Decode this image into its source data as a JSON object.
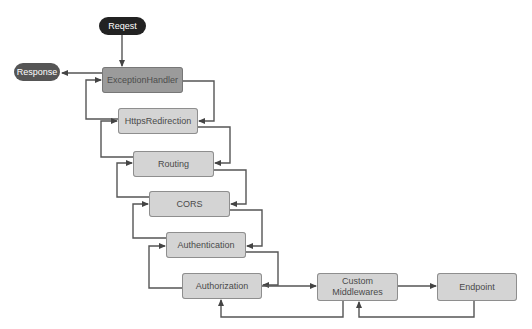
{
  "diagram": {
    "colors": {
      "request_fill": "#222222",
      "response_fill": "#555555",
      "highlight_node_fill": "#9b9b9b",
      "node_fill": "#d4d4d4",
      "edge": "#555555"
    },
    "terminals": {
      "request": "Reqest",
      "response": "Response"
    },
    "nodes": [
      {
        "id": "exception_handler",
        "label": "ExceptionHandler"
      },
      {
        "id": "https_redirection",
        "label": "HttpsRedirection"
      },
      {
        "id": "routing",
        "label": "Routing"
      },
      {
        "id": "cors",
        "label": "CORS"
      },
      {
        "id": "authentication",
        "label": "Authentication"
      },
      {
        "id": "authorization",
        "label": "Authorization"
      },
      {
        "id": "custom_middlewares",
        "label": "Custom Middlewares"
      },
      {
        "id": "endpoint",
        "label": "Endpoint"
      }
    ],
    "edges": [
      {
        "from": "request",
        "to": "exception_handler"
      },
      {
        "from": "exception_handler",
        "to": "https_redirection"
      },
      {
        "from": "https_redirection",
        "to": "routing"
      },
      {
        "from": "routing",
        "to": "cors"
      },
      {
        "from": "cors",
        "to": "authentication"
      },
      {
        "from": "authentication",
        "to": "authorization"
      },
      {
        "from": "authorization",
        "to": "custom_middlewares"
      },
      {
        "from": "custom_middlewares",
        "to": "endpoint"
      },
      {
        "from": "endpoint",
        "to": "custom_middlewares",
        "kind": "return"
      },
      {
        "from": "custom_middlewares",
        "to": "authorization",
        "kind": "return"
      },
      {
        "from": "authorization",
        "to": "authentication",
        "kind": "return"
      },
      {
        "from": "authentication",
        "to": "cors",
        "kind": "return"
      },
      {
        "from": "cors",
        "to": "routing",
        "kind": "return"
      },
      {
        "from": "routing",
        "to": "https_redirection",
        "kind": "return"
      },
      {
        "from": "https_redirection",
        "to": "exception_handler",
        "kind": "return"
      },
      {
        "from": "exception_handler",
        "to": "response",
        "kind": "return"
      }
    ]
  }
}
